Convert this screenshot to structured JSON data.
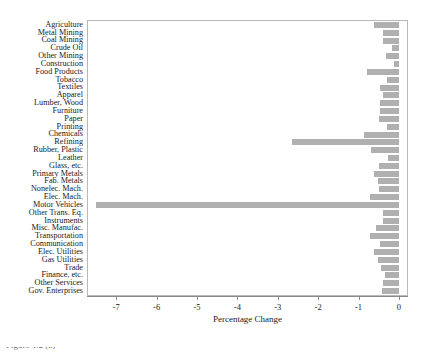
{
  "chart_data": {
    "type": "bar",
    "orientation": "horizontal",
    "title": "",
    "xlabel": "Percentage Change",
    "ylabel": "",
    "xlim": [
      -7.7,
      0.2
    ],
    "xticks": [
      -7,
      -6,
      -5,
      -4,
      -3,
      -2,
      -1,
      0
    ],
    "xticklabels": [
      "-7",
      "-6",
      "-5",
      "-4",
      "-3",
      "-2",
      "-1",
      "0"
    ],
    "grid": false,
    "legend": null,
    "bar_color": "#b0b0b0",
    "frame_color": "#b9b9b9",
    "categories": [
      "Agriculture",
      "Metal Mining",
      "Coal Mining",
      "Crude Oil",
      "Other Mining",
      "Construction",
      "Food Products",
      "Tobacco",
      "Textiles",
      "Apparel",
      "Lumber, Wood",
      "Furniture",
      "Paper",
      "Printing",
      "Chemicals",
      "Refining",
      "Rubber, Plastic",
      "Leather",
      "Glass, etc.",
      "Primary Metals",
      "Fab. Metals",
      "Nonelec. Mach.",
      "Elec. Mach.",
      "Motor Vehicles",
      "Other Trans. Eq.",
      "Instruments",
      "Misc. Manufac.",
      "Transportation",
      "Communication",
      "Elec. Utilities",
      "Gas Utilities",
      "Trade",
      "Finance, etc.",
      "Other Services",
      "Gov. Enterprises"
    ],
    "values": [
      -0.62,
      -0.4,
      -0.4,
      -0.18,
      -0.32,
      -0.12,
      -0.78,
      -0.3,
      -0.46,
      -0.4,
      -0.48,
      -0.48,
      -0.5,
      -0.3,
      -0.86,
      -2.66,
      -0.7,
      -0.28,
      -0.5,
      -0.62,
      -0.52,
      -0.5,
      -0.72,
      -7.5,
      -0.4,
      -0.4,
      -0.58,
      -0.72,
      -0.46,
      -0.62,
      -0.52,
      -0.44,
      -0.34,
      -0.4,
      -0.42
    ]
  },
  "caption": {
    "text": "Figure 1.2 (a)"
  }
}
